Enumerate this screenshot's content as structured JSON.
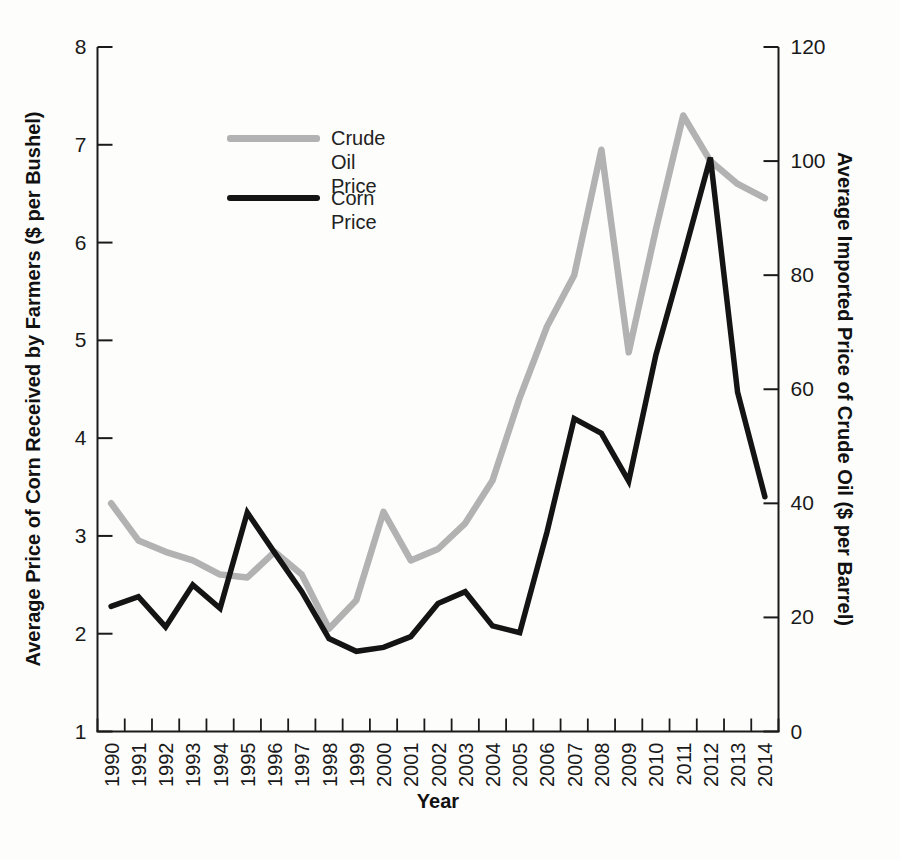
{
  "page": {
    "background": "#fdfdfc"
  },
  "legend": {
    "items": [
      {
        "label": "Crude Oil Price",
        "color": "#b2b2b2"
      },
      {
        "label": "Corn Price",
        "color": "#141414"
      }
    ]
  },
  "chart_data": {
    "type": "line",
    "title": "",
    "x": [
      1990,
      1991,
      1992,
      1993,
      1994,
      1995,
      1996,
      1997,
      1998,
      1999,
      2000,
      2001,
      2002,
      2003,
      2004,
      2005,
      2006,
      2007,
      2008,
      2009,
      2010,
      2011,
      2012,
      2013,
      2014
    ],
    "series": [
      {
        "name": "Crude Oil Price",
        "axis": "right",
        "color": "#b2b2b2",
        "values": [
          40,
          33.5,
          31.5,
          30,
          27.5,
          27,
          31.5,
          27.5,
          18,
          23,
          38.5,
          30,
          32,
          36.5,
          44,
          58.5,
          71,
          80,
          102,
          66.5,
          88,
          108,
          100,
          96,
          93.5
        ]
      },
      {
        "name": "Corn Price",
        "axis": "left",
        "color": "#141414",
        "values": [
          2.28,
          2.38,
          2.07,
          2.5,
          2.26,
          3.24,
          2.83,
          2.43,
          1.95,
          1.82,
          1.86,
          1.97,
          2.31,
          2.43,
          2.08,
          2.01,
          3.04,
          4.2,
          4.05,
          3.56,
          4.85,
          5.85,
          6.87,
          4.47,
          3.4
        ]
      }
    ],
    "left_axis": {
      "label": "Average Price of Corn Received by Farmers ($ per Bushel)",
      "min": 1,
      "max": 8,
      "ticks": [
        1,
        2,
        3,
        4,
        5,
        6,
        7,
        8
      ]
    },
    "right_axis": {
      "label": "Average Imported Price of Crude Oil ($ per Barrel)",
      "min": 0,
      "max": 120,
      "ticks": [
        0,
        20,
        40,
        60,
        80,
        100,
        120
      ]
    },
    "x_axis": {
      "label": "Year",
      "tick_style": "cell-boundaries",
      "labels_rotated": true
    },
    "legend_position": "top-left-inside",
    "grid": false,
    "axis_color": "#1a1a1a"
  }
}
